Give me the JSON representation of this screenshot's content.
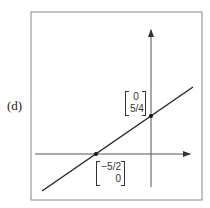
{
  "figure": {
    "part_label": "(d)",
    "frame": {
      "x": 31,
      "y": 12,
      "width": 171,
      "height": 188
    },
    "axes": {
      "x_axis": {
        "y": 154,
        "x_start": 35,
        "x_end": 190
      },
      "y_axis": {
        "x": 151,
        "y_start": 187,
        "y_end": 30
      }
    },
    "line": {
      "x1": 42,
      "y1": 191,
      "x2": 193,
      "y2": 87,
      "color": "#222222"
    },
    "points": [
      {
        "name": "x-intercept",
        "cx": 96,
        "cy": 154,
        "vector": [
          "−5/2",
          "0"
        ]
      },
      {
        "name": "y-intercept",
        "cx": 151,
        "cy": 116,
        "vector": [
          "0",
          "5/4"
        ]
      }
    ]
  }
}
